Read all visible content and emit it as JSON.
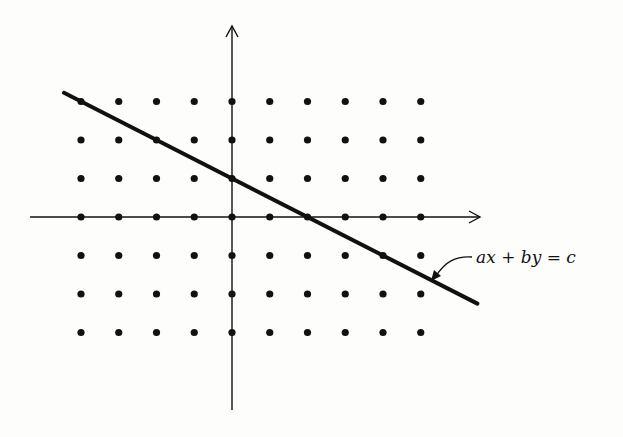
{
  "figure": {
    "type": "lattice-line-diagram",
    "line_label": "ax + by = c",
    "line_label_parts": {
      "a": "ax",
      "plus": "+",
      "b": "by",
      "eq": "=",
      "c": "c"
    },
    "colors": {
      "ink": "#111111",
      "background": "#fdfdfb"
    }
  },
  "lattice": {
    "x_range": [
      -4,
      5
    ],
    "y_range": [
      -3,
      3
    ]
  },
  "line": {
    "slope": -0.5,
    "intercept": 1,
    "lattice_points_on_line": [
      [
        -4,
        3
      ],
      [
        -2,
        2
      ],
      [
        0,
        1
      ],
      [
        2,
        0
      ],
      [
        4,
        -1
      ]
    ],
    "x_extent": [
      -4.45,
      6.5
    ]
  },
  "axes": {
    "x_axis": {
      "arrow": "right"
    },
    "y_axis": {
      "arrow": "up"
    }
  }
}
